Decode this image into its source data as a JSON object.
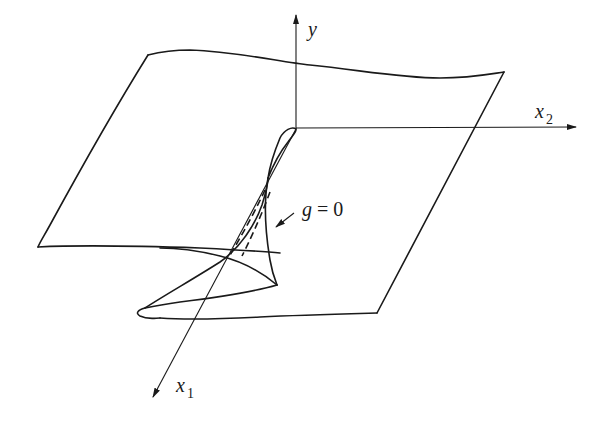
{
  "figure": {
    "type": "3d-surface-fold-diagram",
    "axes": {
      "y": {
        "label": "y",
        "subscript": ""
      },
      "x2": {
        "label": "x",
        "subscript": "2"
      },
      "x1": {
        "label": "x",
        "subscript": "1"
      }
    },
    "annotations": [
      {
        "id": "fold-curve-label",
        "lhs": "g",
        "rel": " = ",
        "rhs": "0"
      }
    ],
    "colors": {
      "ink": "#1a1a1a",
      "background": "#ffffff"
    }
  }
}
